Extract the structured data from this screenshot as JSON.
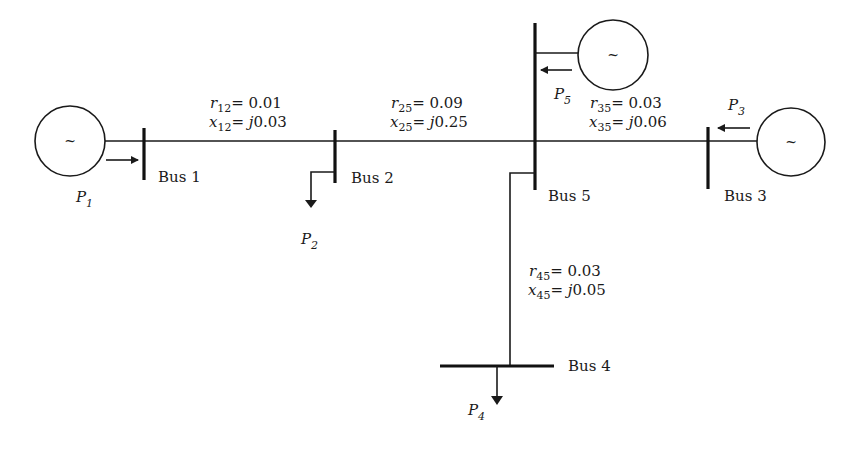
{
  "diagram": {
    "type": "five-bus power system one-line diagram",
    "buses": [
      {
        "id": 1,
        "label": "Bus 1"
      },
      {
        "id": 2,
        "label": "Bus 2"
      },
      {
        "id": 3,
        "label": "Bus 3"
      },
      {
        "id": 4,
        "label": "Bus 4"
      },
      {
        "id": 5,
        "label": "Bus 5"
      }
    ],
    "generators": [
      {
        "bus": 1,
        "symbol": "~",
        "power_label": "P",
        "power_sub": "1"
      },
      {
        "bus": 3,
        "symbol": "~",
        "power_label": "P",
        "power_sub": "3"
      },
      {
        "bus": 5,
        "symbol": "~",
        "power_label": "P",
        "power_sub": "5"
      }
    ],
    "loads": [
      {
        "bus": 2,
        "power_label": "P",
        "power_sub": "2"
      },
      {
        "bus": 4,
        "power_label": "P",
        "power_sub": "4"
      }
    ],
    "lines": [
      {
        "from": 1,
        "to": 2,
        "r_sym": "r",
        "r_sub": "12",
        "r_val": "= 0.01",
        "x_sym": "x",
        "x_sub": "12",
        "x_j": "= j",
        "x_val": "0.03"
      },
      {
        "from": 2,
        "to": 5,
        "r_sym": "r",
        "r_sub": "25",
        "r_val": "= 0.09",
        "x_sym": "x",
        "x_sub": "25",
        "x_j": "= j",
        "x_val": "0.25"
      },
      {
        "from": 3,
        "to": 5,
        "r_sym": "r",
        "r_sub": "35",
        "r_val": "= 0.03",
        "x_sym": "x",
        "x_sub": "35",
        "x_j": "= j",
        "x_val": "0.06"
      },
      {
        "from": 4,
        "to": 5,
        "r_sym": "r",
        "r_sub": "45",
        "r_val": "= 0.03",
        "x_sym": "x",
        "x_sub": "45",
        "x_j": "= j",
        "x_val": "0.05"
      }
    ],
    "colors": {
      "ink": "#1a1a1a",
      "background": "#ffffff"
    }
  }
}
